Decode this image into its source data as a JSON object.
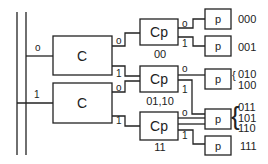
{
  "diagram": {
    "bus": {
      "label_0": "o",
      "label_1": "1"
    },
    "c_boxes": [
      {
        "label": "C",
        "out0": "o",
        "out1": "1"
      },
      {
        "label": "C",
        "out0": "o",
        "out1": "1"
      }
    ],
    "cp_boxes": [
      {
        "label": "Cp",
        "caption": "00",
        "out0": "o",
        "out1": "1"
      },
      {
        "label": "Cp",
        "caption": "01,10",
        "out0": "o",
        "out1": "1"
      },
      {
        "label": "Cp",
        "caption": "11",
        "out0": "o",
        "out1": "1"
      }
    ],
    "p_boxes": [
      {
        "label": "p",
        "codes": [
          "000"
        ]
      },
      {
        "label": "p",
        "codes": [
          "001"
        ]
      },
      {
        "label": "p",
        "codes": [
          "010",
          "100"
        ]
      },
      {
        "label": "p",
        "codes": [
          "011",
          "101",
          "110"
        ]
      },
      {
        "label": "p",
        "codes": [
          "111"
        ]
      }
    ]
  }
}
